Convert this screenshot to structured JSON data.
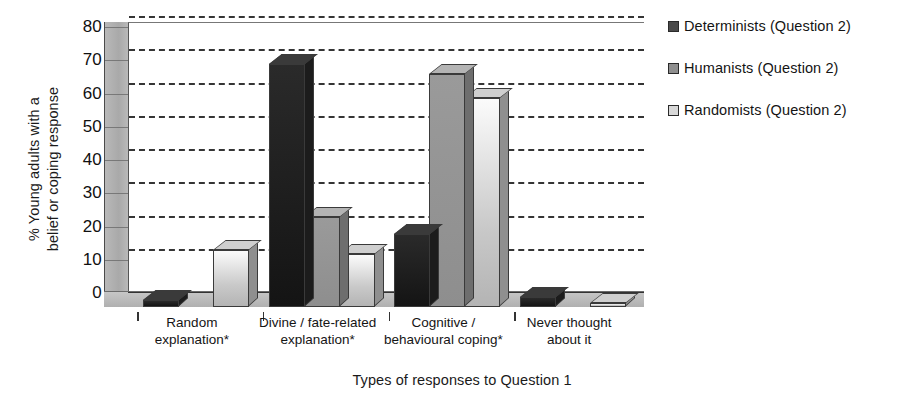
{
  "chart_data": {
    "type": "bar",
    "title": "",
    "xlabel": "Types of responses to Question 1",
    "ylabel": "% Young adults with a belief or coping response",
    "ylabel_lines": [
      "% Young adults with a",
      "belief or coping response"
    ],
    "ylim": [
      0,
      80
    ],
    "yticks": [
      0,
      10,
      20,
      30,
      40,
      50,
      60,
      70,
      80
    ],
    "grid": true,
    "legend_position": "right",
    "style": "3d-grouped-bar",
    "categories": [
      "Random explanation*",
      "Divine / fate-related explanation*",
      "Cognitive / behavioural coping*",
      "Never thought about it"
    ],
    "category_lines": [
      [
        "Random",
        "explanation*"
      ],
      [
        "Divine / fate-related",
        "explanation*"
      ],
      [
        "Cognitive /",
        "behavioural coping*"
      ],
      [
        "Never thought",
        "about it"
      ]
    ],
    "series": [
      {
        "name": "Determinists (Question 2)",
        "color": "#1f1f1f",
        "values": [
          2,
          73,
          22,
          3
        ]
      },
      {
        "name": "Humanists (Question 2)",
        "color": "#8f8f8f",
        "values": [
          0,
          27,
          70,
          0
        ]
      },
      {
        "name": "Randomists (Question 2)",
        "color": "#d8d8d8",
        "values": [
          17,
          16,
          63,
          1
        ]
      }
    ]
  },
  "legend": {
    "items": [
      {
        "label": "Determinists (Question 2)"
      },
      {
        "label": "Humanists (Question 2)"
      },
      {
        "label": "Randomists (Question 2)"
      }
    ]
  },
  "axes": {
    "y_title_line1": "% Young adults with a",
    "y_title_line2": "belief or coping response",
    "x_title": "Types of responses to Question 1"
  }
}
